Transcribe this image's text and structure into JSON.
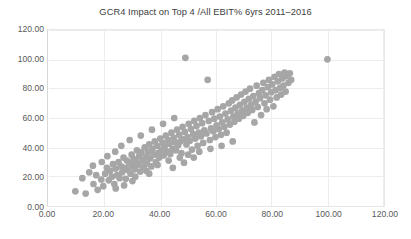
{
  "chart_data": {
    "type": "scatter",
    "title": "GCR4 Impact on Top 4 /All EBIT% 6yrs 2011–2016",
    "xlabel": "",
    "ylabel": "",
    "xlim": [
      0,
      120
    ],
    "ylim": [
      0,
      120
    ],
    "xticks": [
      0,
      20,
      40,
      60,
      80,
      100,
      120
    ],
    "yticks": [
      0,
      20,
      40,
      60,
      80,
      100,
      120
    ],
    "xtick_labels": [
      "0.00",
      "20.00",
      "40.00",
      "60.00",
      "80.00",
      "100.00",
      "120.00"
    ],
    "ytick_labels": [
      "0.00",
      "20.00",
      "40.00",
      "60.00",
      "80.00",
      "100.00",
      "120.00"
    ],
    "grid": true,
    "legend": false,
    "marker_color": "#a6a6a6",
    "marker_size": 3.4,
    "series": [
      {
        "name": "Companies",
        "points": [
          [
            9.5,
            10.0
          ],
          [
            13.2,
            8.5
          ],
          [
            16.0,
            15.0
          ],
          [
            17.5,
            11.0
          ],
          [
            18.8,
            18.0
          ],
          [
            19.5,
            13.5
          ],
          [
            20.2,
            22.0
          ],
          [
            20.8,
            26.0
          ],
          [
            21.5,
            17.5
          ],
          [
            22.0,
            24.0
          ],
          [
            22.6,
            20.0
          ],
          [
            23.0,
            28.5
          ],
          [
            23.5,
            15.0
          ],
          [
            24.0,
            25.5
          ],
          [
            24.5,
            21.0
          ],
          [
            25.0,
            30.0
          ],
          [
            25.4,
            19.0
          ],
          [
            25.9,
            27.0
          ],
          [
            26.3,
            23.0
          ],
          [
            26.8,
            33.0
          ],
          [
            27.2,
            26.0
          ],
          [
            27.6,
            18.5
          ],
          [
            28.0,
            31.0
          ],
          [
            28.4,
            24.5
          ],
          [
            28.9,
            29.0
          ],
          [
            29.3,
            22.0
          ],
          [
            29.7,
            35.0
          ],
          [
            30.0,
            27.5
          ],
          [
            30.4,
            32.0
          ],
          [
            30.8,
            25.0
          ],
          [
            31.2,
            30.5
          ],
          [
            31.6,
            38.0
          ],
          [
            32.0,
            28.0
          ],
          [
            32.4,
            34.0
          ],
          [
            32.8,
            23.5
          ],
          [
            33.2,
            36.5
          ],
          [
            33.6,
            31.0
          ],
          [
            34.0,
            26.5
          ],
          [
            34.4,
            40.0
          ],
          [
            34.8,
            33.5
          ],
          [
            35.2,
            29.0
          ],
          [
            35.6,
            37.0
          ],
          [
            36.0,
            42.0
          ],
          [
            36.4,
            32.5
          ],
          [
            36.8,
            27.0
          ],
          [
            37.2,
            39.0
          ],
          [
            37.6,
            35.0
          ],
          [
            38.0,
            44.0
          ],
          [
            38.4,
            30.0
          ],
          [
            38.8,
            41.0
          ],
          [
            39.2,
            36.0
          ],
          [
            39.6,
            33.0
          ],
          [
            40.0,
            46.0
          ],
          [
            40.4,
            38.5
          ],
          [
            40.8,
            43.0
          ],
          [
            41.2,
            34.5
          ],
          [
            41.6,
            40.5
          ],
          [
            42.0,
            48.0
          ],
          [
            42.4,
            37.0
          ],
          [
            42.8,
            45.0
          ],
          [
            43.2,
            42.5
          ],
          [
            43.6,
            35.5
          ],
          [
            44.0,
            50.0
          ],
          [
            44.4,
            39.0
          ],
          [
            44.8,
            46.5
          ],
          [
            45.2,
            43.5
          ],
          [
            45.6,
            38.0
          ],
          [
            46.0,
            52.0
          ],
          [
            46.4,
            41.5
          ],
          [
            46.8,
            48.5
          ],
          [
            47.2,
            44.0
          ],
          [
            47.6,
            36.0
          ],
          [
            48.0,
            54.0
          ],
          [
            48.4,
            45.5
          ],
          [
            48.8,
            50.5
          ],
          [
            49.0,
            101.0
          ],
          [
            49.4,
            42.0
          ],
          [
            49.8,
            47.0
          ],
          [
            50.2,
            56.0
          ],
          [
            50.6,
            44.5
          ],
          [
            51.0,
            52.5
          ],
          [
            51.4,
            38.5
          ],
          [
            51.8,
            49.0
          ],
          [
            52.2,
            58.0
          ],
          [
            52.6,
            46.0
          ],
          [
            53.0,
            54.5
          ],
          [
            53.4,
            41.0
          ],
          [
            53.8,
            50.0
          ],
          [
            54.2,
            60.0
          ],
          [
            54.6,
            47.5
          ],
          [
            55.0,
            56.5
          ],
          [
            55.4,
            43.0
          ],
          [
            55.8,
            51.5
          ],
          [
            56.2,
            62.0
          ],
          [
            56.6,
            49.5
          ],
          [
            57.0,
            86.0
          ],
          [
            57.4,
            58.0
          ],
          [
            57.8,
            45.0
          ],
          [
            58.2,
            53.0
          ],
          [
            58.6,
            64.0
          ],
          [
            59.0,
            51.0
          ],
          [
            59.4,
            59.5
          ],
          [
            59.8,
            47.0
          ],
          [
            60.2,
            55.0
          ],
          [
            60.6,
            66.0
          ],
          [
            61.0,
            52.5
          ],
          [
            61.4,
            61.0
          ],
          [
            61.8,
            48.5
          ],
          [
            62.2,
            57.0
          ],
          [
            62.6,
            68.0
          ],
          [
            63.0,
            54.0
          ],
          [
            63.4,
            63.0
          ],
          [
            63.8,
            50.0
          ],
          [
            64.2,
            59.0
          ],
          [
            64.6,
            70.0
          ],
          [
            65.0,
            55.5
          ],
          [
            65.4,
            65.0
          ],
          [
            65.8,
            72.0
          ],
          [
            66.2,
            61.0
          ],
          [
            66.6,
            57.5
          ],
          [
            67.0,
            67.0
          ],
          [
            67.4,
            74.0
          ],
          [
            67.8,
            63.0
          ],
          [
            68.2,
            59.5
          ],
          [
            68.6,
            69.0
          ],
          [
            69.0,
            76.0
          ],
          [
            69.4,
            65.0
          ],
          [
            69.8,
            61.5
          ],
          [
            70.2,
            71.0
          ],
          [
            70.6,
            78.0
          ],
          [
            71.0,
            67.0
          ],
          [
            71.4,
            63.5
          ],
          [
            71.8,
            73.0
          ],
          [
            72.2,
            80.0
          ],
          [
            72.6,
            69.0
          ],
          [
            73.0,
            65.5
          ],
          [
            73.4,
            75.0
          ],
          [
            73.8,
            57.0
          ],
          [
            74.2,
            71.0
          ],
          [
            74.6,
            82.0
          ],
          [
            75.0,
            67.5
          ],
          [
            75.4,
            77.0
          ],
          [
            75.8,
            73.5
          ],
          [
            76.2,
            62.0
          ],
          [
            76.6,
            79.0
          ],
          [
            77.0,
            84.0
          ],
          [
            77.4,
            70.0
          ],
          [
            77.8,
            75.5
          ],
          [
            78.2,
            66.0
          ],
          [
            78.6,
            81.0
          ],
          [
            79.0,
            86.0
          ],
          [
            79.4,
            72.5
          ],
          [
            79.8,
            77.5
          ],
          [
            80.2,
            83.0
          ],
          [
            80.6,
            68.0
          ],
          [
            81.0,
            88.0
          ],
          [
            81.4,
            79.0
          ],
          [
            81.8,
            74.0
          ],
          [
            82.2,
            85.0
          ],
          [
            82.6,
            90.0
          ],
          [
            83.0,
            80.5
          ],
          [
            83.4,
            76.0
          ],
          [
            83.8,
            87.0
          ],
          [
            84.2,
            82.0
          ],
          [
            84.6,
            91.0
          ],
          [
            85.0,
            78.0
          ],
          [
            85.4,
            88.5
          ],
          [
            86.0,
            84.0
          ],
          [
            86.5,
            90.5
          ],
          [
            87.0,
            86.0
          ],
          [
            12.0,
            19.0
          ],
          [
            14.5,
            23.0
          ],
          [
            15.8,
            27.5
          ],
          [
            17.0,
            21.0
          ],
          [
            19.0,
            30.0
          ],
          [
            21.0,
            34.0
          ],
          [
            23.8,
            37.0
          ],
          [
            26.0,
            41.0
          ],
          [
            27.0,
            14.0
          ],
          [
            29.0,
            45.0
          ],
          [
            31.0,
            20.0
          ],
          [
            33.0,
            48.0
          ],
          [
            35.0,
            24.0
          ],
          [
            37.0,
            52.0
          ],
          [
            39.0,
            28.0
          ],
          [
            41.0,
            56.0
          ],
          [
            43.0,
            31.0
          ],
          [
            45.0,
            60.0
          ],
          [
            47.0,
            33.0
          ],
          [
            50.0,
            35.0
          ],
          [
            54.0,
            37.0
          ],
          [
            58.0,
            39.0
          ],
          [
            62.0,
            41.0
          ],
          [
            66.0,
            44.0
          ],
          [
            44.5,
            26.0
          ],
          [
            36.0,
            22.0
          ],
          [
            30.0,
            17.0
          ],
          [
            24.0,
            12.0
          ],
          [
            52.0,
            33.0
          ],
          [
            48.5,
            29.5
          ],
          [
            100.0,
            100.0
          ]
        ]
      }
    ]
  }
}
